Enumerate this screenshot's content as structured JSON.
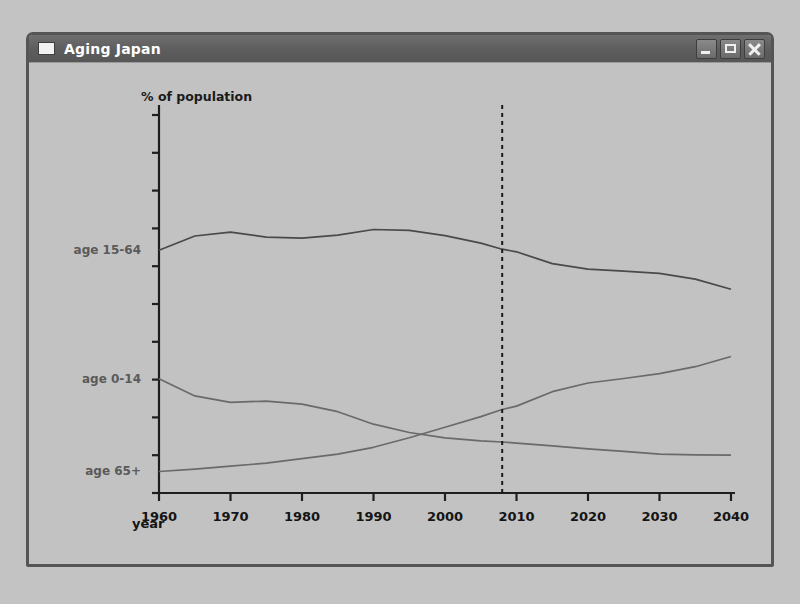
{
  "window": {
    "title": "Aging Japan",
    "icon": "window-icon",
    "buttons": [
      {
        "name": "minimize",
        "glyph": "minimize-icon"
      },
      {
        "name": "maximize",
        "glyph": "maximize-icon"
      },
      {
        "name": "close",
        "glyph": "close-icon"
      }
    ]
  },
  "chart_data": {
    "type": "line",
    "title": "",
    "ylabel": "% of population",
    "xlabel": "year",
    "xlim": [
      1960,
      2040
    ],
    "xticks": [
      1960,
      1970,
      1980,
      1990,
      2000,
      2010,
      2020,
      2030,
      2040
    ],
    "xtick_labels": [
      "1960",
      "1970",
      "1980",
      "1990",
      "2000",
      "2010",
      "2020",
      "2030",
      "2040"
    ],
    "ylim": [
      0,
      100
    ],
    "yticks": [
      0,
      10,
      20,
      30,
      40,
      50,
      60,
      70,
      80,
      90,
      100
    ],
    "ytick_labels": [],
    "grid": false,
    "legend": "inline-left",
    "annotations": [
      {
        "type": "vline",
        "x": 2008,
        "style": "dashed",
        "color": "#1a1a1a",
        "label": ""
      }
    ],
    "x": [
      1960,
      1965,
      1970,
      1975,
      1980,
      1985,
      1990,
      1995,
      2000,
      2005,
      2008,
      2010,
      2015,
      2020,
      2025,
      2030,
      2035,
      2040
    ],
    "series": [
      {
        "name": "age 15-64",
        "label": "age 15-64",
        "color": "#4a4a4a",
        "values": [
          64.2,
          68.0,
          69.0,
          67.7,
          67.4,
          68.2,
          69.7,
          69.5,
          68.1,
          66.1,
          64.5,
          63.8,
          60.7,
          59.2,
          58.7,
          58.1,
          56.6,
          53.9
        ]
      },
      {
        "name": "age 0-14",
        "label": "age 0-14",
        "color": "#6a6a6a",
        "values": [
          30.2,
          25.7,
          24.0,
          24.3,
          23.5,
          21.5,
          18.2,
          16.0,
          14.6,
          13.8,
          13.5,
          13.2,
          12.5,
          11.7,
          11.0,
          10.3,
          10.1,
          10.0
        ]
      },
      {
        "name": "age 65+",
        "label": "age 65+",
        "color": "#6a6a6a",
        "values": [
          5.7,
          6.3,
          7.1,
          7.9,
          9.1,
          10.3,
          12.1,
          14.6,
          17.4,
          20.2,
          22.1,
          23.0,
          26.8,
          29.1,
          30.3,
          31.6,
          33.4,
          36.1
        ]
      }
    ]
  }
}
